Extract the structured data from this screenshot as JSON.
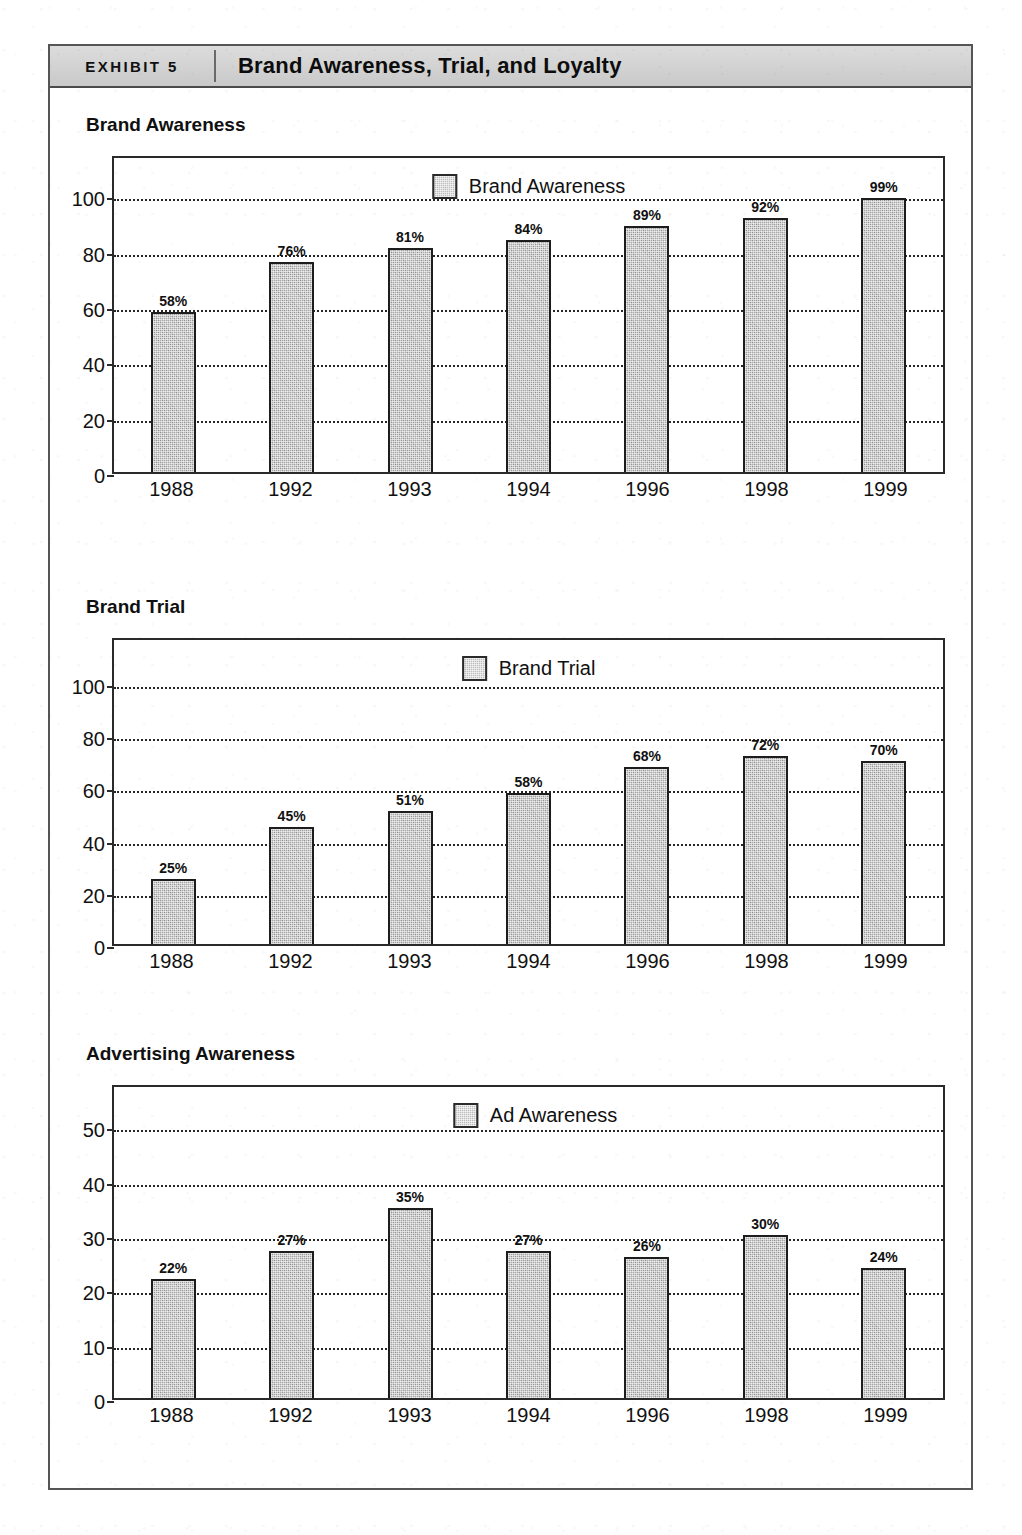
{
  "exhibit": {
    "tag": "EXHIBIT 5",
    "title": "Brand Awareness, Trial, and Loyalty"
  },
  "chart_data": [
    {
      "type": "bar",
      "title": "Brand Awareness",
      "legend": [
        "Brand Awareness"
      ],
      "legend_position": "top-center-inside",
      "xlabel": "",
      "ylabel": "",
      "categories": [
        "1988",
        "1992",
        "1993",
        "1994",
        "1996",
        "1998",
        "1999"
      ],
      "values": [
        58,
        76,
        81,
        84,
        89,
        92,
        99
      ],
      "data_labels": [
        "58%",
        "76%",
        "81%",
        "84%",
        "89%",
        "92%",
        "99%"
      ],
      "yticks": [
        0,
        20,
        40,
        60,
        80,
        100
      ],
      "ytick_labels": [
        "0",
        "20",
        "40",
        "60",
        "80",
        "100"
      ],
      "ylim": [
        0,
        115
      ],
      "grid": true
    },
    {
      "type": "bar",
      "title": "Brand Trial",
      "legend": [
        "Brand Trial"
      ],
      "legend_position": "top-center-inside",
      "xlabel": "",
      "ylabel": "",
      "categories": [
        "1988",
        "1992",
        "1993",
        "1994",
        "1996",
        "1998",
        "1999"
      ],
      "values": [
        25,
        45,
        51,
        58,
        68,
        72,
        70
      ],
      "data_labels": [
        "25%",
        "45%",
        "51%",
        "58%",
        "68%",
        "72%",
        "70%"
      ],
      "yticks": [
        0,
        20,
        40,
        60,
        80,
        100
      ],
      "ytick_labels": [
        "0",
        "20",
        "40",
        "60",
        "80",
        "100"
      ],
      "ylim": [
        0,
        118
      ],
      "grid": true
    },
    {
      "type": "bar",
      "title": "Advertising Awareness",
      "legend": [
        "Ad Awareness"
      ],
      "legend_position": "top-center-inside",
      "xlabel": "",
      "ylabel": "",
      "categories": [
        "1988",
        "1992",
        "1993",
        "1994",
        "1996",
        "1998",
        "1999"
      ],
      "values": [
        22,
        27,
        35,
        27,
        26,
        30,
        24
      ],
      "data_labels": [
        "22%",
        "27%",
        "35%",
        "27%",
        "26%",
        "30%",
        "24%"
      ],
      "yticks": [
        0,
        10,
        20,
        30,
        40,
        50
      ],
      "ytick_labels": [
        "0",
        "10",
        "20",
        "30",
        "40",
        "50"
      ],
      "ylim": [
        0,
        58
      ],
      "grid": true
    }
  ],
  "colors": {
    "bar_fill": "#a9a9a9",
    "bar_border": "#1d1d1d",
    "grid": "#262626",
    "frame": "#2a2a2a",
    "header_band": "#d2d2d2",
    "text": "#111111"
  }
}
